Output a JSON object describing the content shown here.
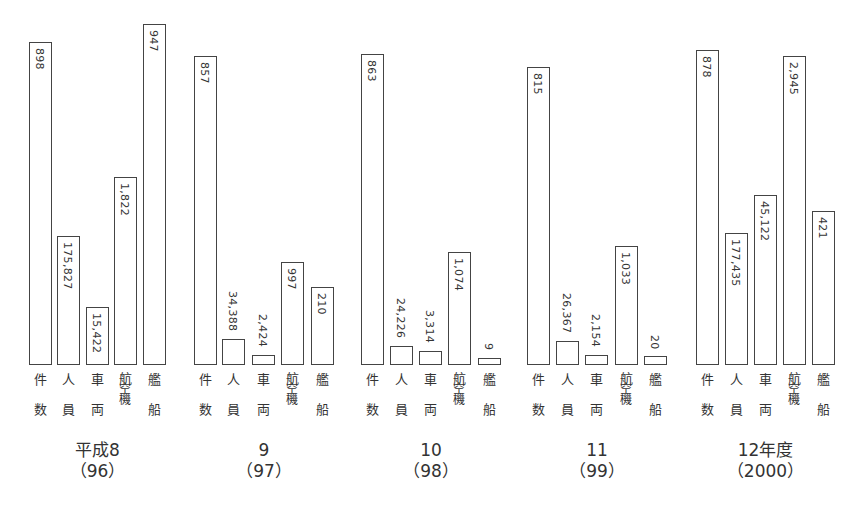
{
  "chart_data": {
    "type": "bar",
    "title": "",
    "xlabel": "",
    "ylabel": "",
    "grid": false,
    "legend": "none",
    "note": "Each category uses its own independent scale; values are printed rotated on or above each bar.",
    "categories": [
      "件数",
      "人員",
      "車両",
      "航空機",
      "艦船"
    ],
    "category_label_lines": [
      [
        "件",
        "数"
      ],
      [
        "人",
        "員"
      ],
      [
        "車",
        "両"
      ],
      [
        "航",
        "空",
        "機"
      ],
      [
        "艦",
        "船"
      ]
    ],
    "groups": [
      {
        "label_line1": "平成8",
        "label_line2": "（96）",
        "values": [
          898,
          175827,
          15422,
          1822,
          947
        ],
        "value_labels": [
          "898",
          "175,827",
          "15,422",
          "1,822",
          "947"
        ]
      },
      {
        "label_line1": "9",
        "label_line2": "（97）",
        "values": [
          857,
          34388,
          2424,
          997,
          210
        ],
        "value_labels": [
          "857",
          "34,388",
          "2,424",
          "997",
          "210"
        ]
      },
      {
        "label_line1": "10",
        "label_line2": "（98）",
        "values": [
          863,
          24226,
          3314,
          1074,
          9
        ],
        "value_labels": [
          "863",
          "24,226",
          "3,314",
          "1,074",
          "9"
        ]
      },
      {
        "label_line1": "11",
        "label_line2": "（99）",
        "values": [
          815,
          26367,
          2154,
          1033,
          20
        ],
        "value_labels": [
          "815",
          "26,367",
          "2,154",
          "1,033",
          "20"
        ]
      },
      {
        "label_line1": "12年度",
        "label_line2": "（2000）",
        "values": [
          878,
          177435,
          45122,
          2945,
          421
        ],
        "value_labels": [
          "878",
          "177,435",
          "45,122",
          "2,945",
          "421"
        ]
      }
    ],
    "series": [
      {
        "name": "件数",
        "values": [
          898,
          857,
          863,
          815,
          878
        ]
      },
      {
        "name": "人員",
        "values": [
          175827,
          34388,
          24226,
          26367,
          177435
        ]
      },
      {
        "name": "車両",
        "values": [
          15422,
          2424,
          3314,
          2154,
          45122
        ]
      },
      {
        "name": "航空機",
        "values": [
          1822,
          997,
          1074,
          1033,
          2945
        ]
      },
      {
        "name": "艦船",
        "values": [
          947,
          210,
          9,
          20,
          421
        ]
      }
    ],
    "x": [
      "平成8（96）",
      "9（97）",
      "10（98）",
      "11（99）",
      "12年度（2000）"
    ]
  },
  "colors": {
    "bar_fill": "#ffffff",
    "bar_stroke": "#444444",
    "text": "#333333"
  }
}
